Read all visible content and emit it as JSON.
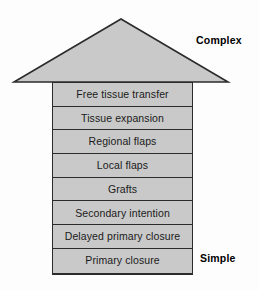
{
  "figure": {
    "colors": {
      "fill": "#c9c9c9",
      "stroke": "#2b2b2b",
      "background": "#fdfdfd",
      "text": "#1a1a1a"
    },
    "arrow": {
      "head_name": "arrow-head-triangle",
      "direction": "up"
    },
    "end_labels": {
      "top": "Complex",
      "bottom": "Simple"
    },
    "rungs": [
      {
        "label": "Free tissue transfer"
      },
      {
        "label": "Tissue expansion"
      },
      {
        "label": "Regional flaps"
      },
      {
        "label": "Local flaps"
      },
      {
        "label": "Grafts"
      },
      {
        "label": "Secondary intention"
      },
      {
        "label": "Delayed primary closure"
      },
      {
        "label": "Primary closure"
      }
    ]
  }
}
